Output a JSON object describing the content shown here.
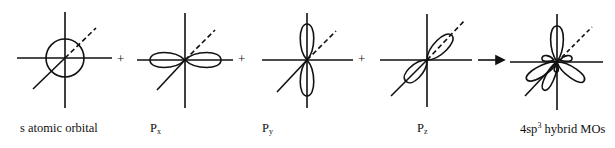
{
  "figure": {
    "panels": [
      {
        "id": "s",
        "label_main": "s atomic orbital",
        "label_sub": "",
        "label_sup": "",
        "label_tail": ""
      },
      {
        "id": "px",
        "label_main": "P",
        "label_sub": "x",
        "label_sup": "",
        "label_tail": ""
      },
      {
        "id": "py",
        "label_main": "P",
        "label_sub": "y",
        "label_sup": "",
        "label_tail": ""
      },
      {
        "id": "pz",
        "label_main": "P",
        "label_sub": "z",
        "label_sup": "",
        "label_tail": ""
      },
      {
        "id": "sp3",
        "label_main": "4sp",
        "label_sub": "",
        "label_sup": "3",
        "label_tail": " hybrid MOs"
      }
    ],
    "operators": [
      "+",
      "+",
      "+"
    ],
    "arrow": "right-arrow",
    "colors": {
      "stroke": "#111111",
      "background": "#ffffff"
    }
  }
}
